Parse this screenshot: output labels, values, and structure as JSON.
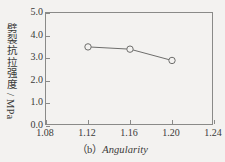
{
  "chart_data": {
    "type": "line",
    "title": "",
    "subtitle": "",
    "xlabel": "Angularity",
    "ylabel": "劈裂抗拉强度 / MPa",
    "xlim": [
      1.08,
      1.24
    ],
    "ylim": [
      0.0,
      5.0
    ],
    "grid": false,
    "legend": "none",
    "x": [
      1.12,
      1.16,
      1.2
    ],
    "values": [
      3.5,
      3.4,
      2.9
    ],
    "series": [
      {
        "name": "劈裂抗拉强度",
        "x": [
          1.12,
          1.16,
          1.2
        ],
        "values": [
          3.5,
          3.4,
          2.9
        ],
        "marker": "open-circle",
        "line_color": "#6e6e6c",
        "marker_color": "#6e6e6c"
      }
    ],
    "xticks": [
      1.08,
      1.12,
      1.16,
      1.2,
      1.24
    ],
    "xtick_labels": [
      "1.08",
      "1.12",
      "1.16",
      "1.20",
      "1.24"
    ],
    "yticks": [
      0.0,
      1.0,
      2.0,
      3.0,
      4.0,
      5.0
    ],
    "ytick_labels": [
      "0.0",
      "1.0",
      "2.0",
      "3.0",
      "4.0",
      "5.0"
    ]
  },
  "axes": {
    "y_title": "劈裂抗拉强度 / MPa",
    "x_tick_labels": [
      "1.08",
      "1.12",
      "1.16",
      "1.20",
      "1.24"
    ],
    "y_tick_labels": [
      "5.0",
      "4.0",
      "3.0",
      "2.0",
      "1.0",
      "0.0"
    ]
  },
  "caption": {
    "index": "（b）",
    "text": "Angularity"
  },
  "colors": {
    "background": "#f3f2f0",
    "axis": "#8a8a88",
    "text": "#3a3a38",
    "series": "#6e6e6c"
  }
}
